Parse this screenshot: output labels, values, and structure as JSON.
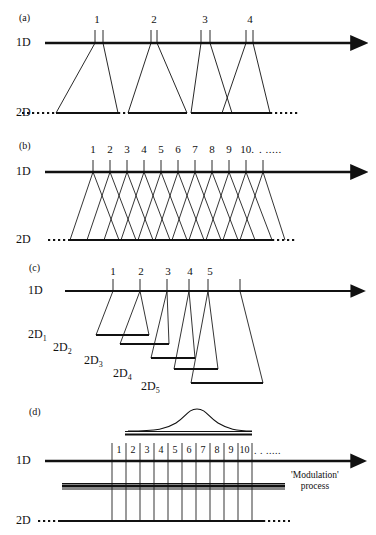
{
  "figure": {
    "kind": "comprehensive-2d-chromatography-modulation-diagram",
    "width": 376,
    "height": 535,
    "stroke_color": "#111111",
    "background": "#ffffff"
  },
  "panels": [
    {
      "id": "a",
      "label": "(a)",
      "axis_1d_label": "1D",
      "axis_2d_label": "2D",
      "tick_numbers": [
        "1",
        "2",
        "3",
        "4"
      ],
      "description": "four wide separated trapezoid slices"
    },
    {
      "id": "b",
      "label": "(b)",
      "axis_1d_label": "1D",
      "axis_2d_label": "2D",
      "tick_numbers": [
        "1",
        "2",
        "3",
        "4",
        "5",
        "6",
        "7",
        "8",
        "9",
        "10."
      ],
      "trailing_ellipsis": ".  .....",
      "description": "ten overlapping crossing trapezoid slices"
    },
    {
      "id": "c",
      "label": "(c)",
      "axis_1d_label": "1D",
      "tick_numbers": [
        "1",
        "2",
        "3",
        "4",
        "5"
      ],
      "second_dim_labels": [
        "2D",
        "2D",
        "2D",
        "2D",
        "2D"
      ],
      "second_dim_subscripts": [
        "1",
        "2",
        "3",
        "4",
        "5"
      ],
      "description": "five staircase trapezoids each landing on its own 2D baseline"
    },
    {
      "id": "d",
      "label": "(d)",
      "axis_1d_label": "1D",
      "axis_2d_label": "2D",
      "tick_numbers": [
        "1",
        "2",
        "3",
        "4",
        "5",
        "6",
        "7",
        "8",
        "9",
        "10"
      ],
      "trailing_ellipsis": ".   .  .....",
      "modulation_label_line1": "'Modulation'",
      "modulation_label_line2": "process",
      "description": "gaussian peak above, modulation bar crossing vertical slice lines"
    }
  ]
}
